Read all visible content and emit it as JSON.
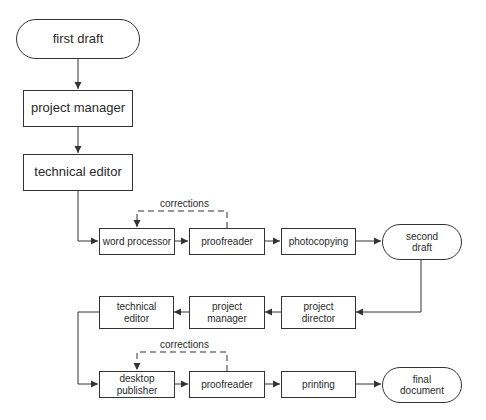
{
  "diagram": {
    "type": "flowchart",
    "line_color": "#333333",
    "background": "#ffffff",
    "nodes": {
      "first_draft": "first draft",
      "project_manager_1": "project manager",
      "technical_editor_1": "technical editor",
      "word_processor": "word processor",
      "proofreader_1": "proofreader",
      "photocopying": "photocopying",
      "second_draft": "second\ndraft",
      "project_director": "project\ndirector",
      "project_manager_2": "project\nmanager",
      "technical_editor_2": "technical\neditor",
      "desktop_publisher": "desktop\npublisher",
      "proofreader_2": "proofreader",
      "printing": "printing",
      "final_document": "final\ndocument"
    },
    "labels": {
      "corrections_1": "corrections",
      "corrections_2": "corrections"
    },
    "edges": [
      {
        "from": "first draft",
        "to": "project manager"
      },
      {
        "from": "project manager",
        "to": "technical editor"
      },
      {
        "from": "technical editor",
        "to": "word processor"
      },
      {
        "from": "word processor",
        "to": "proofreader"
      },
      {
        "from": "proofreader",
        "to": "word processor",
        "label": "corrections",
        "style": "dashed"
      },
      {
        "from": "proofreader",
        "to": "photocopying"
      },
      {
        "from": "photocopying",
        "to": "second draft"
      },
      {
        "from": "second draft",
        "to": "project director"
      },
      {
        "from": "project director",
        "to": "project manager"
      },
      {
        "from": "project manager",
        "to": "technical editor"
      },
      {
        "from": "technical editor",
        "to": "desktop publisher"
      },
      {
        "from": "desktop publisher",
        "to": "proofreader"
      },
      {
        "from": "proofreader",
        "to": "desktop publisher",
        "label": "corrections",
        "style": "dashed"
      },
      {
        "from": "proofreader",
        "to": "printing"
      },
      {
        "from": "printing",
        "to": "final document"
      }
    ]
  }
}
